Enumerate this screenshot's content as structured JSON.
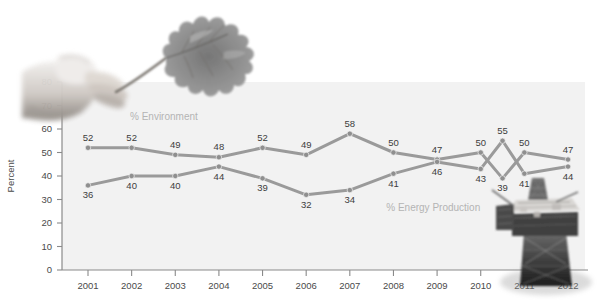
{
  "chart_data": {
    "type": "line",
    "title": "",
    "subtitle": "",
    "xlabel": "",
    "ylabel": "Percent",
    "categories": [
      "2001",
      "2002",
      "2003",
      "2004",
      "2005",
      "2006",
      "2007",
      "2008",
      "2009",
      "2010",
      "2010.5",
      "2011",
      "2012"
    ],
    "x_tick_labels": [
      "2001",
      "2002",
      "2003",
      "2004",
      "2005",
      "2006",
      "2007",
      "2008",
      "2009",
      "2010",
      "2011",
      "2012"
    ],
    "y_tick_labels": [
      "0",
      "10",
      "20",
      "30",
      "40",
      "50",
      "60",
      "70",
      "80"
    ],
    "ylim": [
      0,
      80
    ],
    "y_ticks": [
      0,
      10,
      20,
      30,
      40,
      50,
      60,
      70,
      80
    ],
    "grid": false,
    "legend": "inline-annotations",
    "series": [
      {
        "name": "% Environment",
        "color": "#9a9a9a",
        "label_color": "#b4b4b4",
        "values": [
          52,
          52,
          49,
          48,
          52,
          49,
          58,
          50,
          47,
          50,
          39,
          50,
          47
        ],
        "point_labels": [
          "52",
          "52",
          "49",
          "48",
          "52",
          "49",
          "58",
          "50",
          "47",
          "50",
          "39",
          "50",
          "47"
        ],
        "label_positions": [
          "above",
          "above",
          "above",
          "above",
          "above",
          "above",
          "above",
          "above",
          "above",
          "above",
          "below",
          "above",
          "above"
        ]
      },
      {
        "name": "% Energy Production",
        "color": "#9a9a9a",
        "label_color": "#b4b4b4",
        "values": [
          36,
          40,
          40,
          44,
          39,
          32,
          34,
          41,
          46,
          43,
          55,
          41,
          44
        ],
        "point_labels": [
          "36",
          "40",
          "40",
          "44",
          "39",
          "32",
          "34",
          "41",
          "46",
          "43",
          "55",
          "41",
          "44"
        ],
        "label_positions": [
          "below",
          "below",
          "below",
          "below",
          "below",
          "below",
          "below",
          "below",
          "below",
          "below",
          "above",
          "below",
          "below"
        ]
      }
    ],
    "annotations": [
      {
        "text": "% Environment",
        "x_frac": 0.13,
        "y_value": 64
      },
      {
        "text": "% Energy Production",
        "x_frac": 0.62,
        "y_value": 25
      }
    ],
    "plot_background_color": "#f2f2f2",
    "page_background_color": "#ffffff",
    "axis_color": "#808080",
    "line_color": "#9a9a9a",
    "marker_color": "#8f8f8f"
  },
  "decorations": [
    {
      "name": "hand-holding-oak-leaf-photo",
      "alt": "grayscale photograph of a hand holding an oak leaf"
    },
    {
      "name": "offshore-oil-platform-photo",
      "alt": "grayscale photograph of an offshore oil drilling platform"
    }
  ]
}
